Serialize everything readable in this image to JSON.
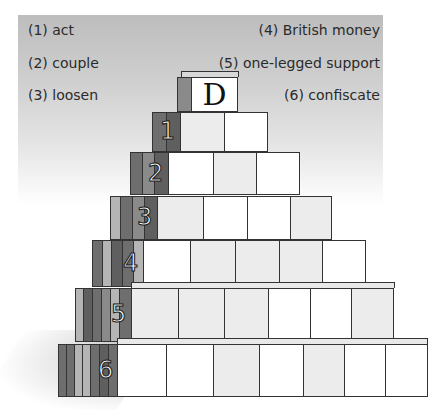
{
  "clues": {
    "left": [
      {
        "num": "(1)",
        "text": "(1) act"
      },
      {
        "num": "(2)",
        "text": "(2) couple"
      },
      {
        "num": "(3)",
        "text": "(3) loosen"
      }
    ],
    "right": [
      {
        "num": "(4)",
        "text": "(4) British money"
      },
      {
        "num": "(5)",
        "text": "(5) one-legged support"
      },
      {
        "num": "(6)",
        "text": "(6) confiscate"
      }
    ]
  },
  "pyramid": {
    "top_letter": "D",
    "rows": [
      {
        "label": "1",
        "boxes": 2
      },
      {
        "label": "2",
        "boxes": 3
      },
      {
        "label": "3",
        "boxes": 4
      },
      {
        "label": "4",
        "boxes": 5
      },
      {
        "label": "5",
        "boxes": 6
      },
      {
        "label": "6",
        "boxes": 7
      }
    ]
  },
  "colors": {
    "panel_gray": "#c4c4c4",
    "side_dark": "#6e6e6e",
    "side_mid": "#8a8a8a",
    "side_light": "#b5b5b5",
    "box_white": "#ffffff",
    "box_gray": "#ececec",
    "outline": "#333333"
  }
}
